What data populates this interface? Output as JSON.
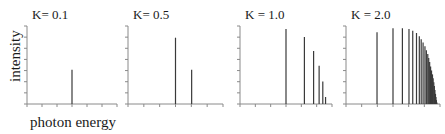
{
  "figure": {
    "xlabel": "photon energy",
    "ylabel": "intensity",
    "colors": {
      "stick": "#3a3a3a",
      "axis": "#8a8a8a",
      "text": "#1a1a1a"
    }
  },
  "chart_data": [
    {
      "type": "bar",
      "title": "K= 0.1",
      "xlabel": "photon energy",
      "ylabel": "intensity",
      "x": [
        0.5
      ],
      "values": [
        0.44
      ],
      "xlim": [
        0,
        1
      ],
      "ylim": [
        0,
        1
      ],
      "grid": false
    },
    {
      "type": "bar",
      "title": "K= 0.5",
      "xlabel": "photon energy",
      "ylabel": "intensity",
      "x": [
        0.5,
        0.67
      ],
      "values": [
        0.85,
        0.44
      ],
      "xlim": [
        0,
        1
      ],
      "ylim": [
        0,
        1
      ],
      "grid": false
    },
    {
      "type": "bar",
      "title": "K = 1.0",
      "xlabel": "photon energy",
      "ylabel": "intensity",
      "x": [
        0.5,
        0.7,
        0.8,
        0.86,
        0.9,
        0.93
      ],
      "values": [
        0.96,
        0.86,
        0.68,
        0.49,
        0.29,
        0.09
      ],
      "xlim": [
        0,
        1
      ],
      "ylim": [
        0,
        1
      ],
      "grid": false
    },
    {
      "type": "bar",
      "title": "K = 2.0",
      "xlabel": "photon energy",
      "ylabel": "intensity",
      "x": [
        0.33,
        0.5,
        0.6,
        0.67,
        0.71,
        0.75,
        0.78,
        0.8,
        0.82,
        0.84,
        0.855,
        0.87,
        0.88,
        0.89,
        0.9,
        0.91,
        0.92,
        0.927,
        0.934,
        0.94,
        0.946,
        0.952,
        0.957,
        0.962,
        0.967
      ],
      "values": [
        0.92,
        0.97,
        0.97,
        0.96,
        0.94,
        0.91,
        0.87,
        0.83,
        0.79,
        0.74,
        0.69,
        0.64,
        0.59,
        0.54,
        0.48,
        0.43,
        0.38,
        0.33,
        0.28,
        0.23,
        0.18,
        0.13,
        0.09,
        0.05,
        0.02
      ],
      "xlim": [
        0,
        1
      ],
      "ylim": [
        0,
        1
      ],
      "grid": false
    }
  ]
}
